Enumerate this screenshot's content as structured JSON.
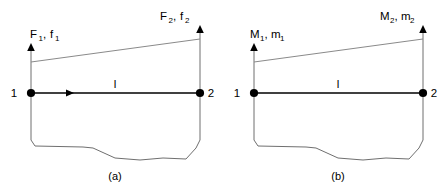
{
  "figure": {
    "colors": {
      "beam": "#000000",
      "guide": "#6f6f6f",
      "slope": "#8a8a8a",
      "text": "#000000",
      "background": "#ffffff"
    }
  },
  "panels": [
    {
      "id": "a",
      "caption": "(a)",
      "quantity": "force",
      "node_start": {
        "label": "1",
        "load_symbol": "F",
        "load_symbol_small": "f",
        "subscript": "1",
        "load_label": "F1, f1",
        "arrow_direction": "up"
      },
      "node_end": {
        "label": "2",
        "load_symbol": "F",
        "load_symbol_small": "f",
        "subscript": "2",
        "load_label": "F2, f2",
        "arrow_direction": "up"
      },
      "length_label": "l",
      "has_axial_arrow": true
    },
    {
      "id": "b",
      "caption": "(b)",
      "quantity": "moment",
      "node_start": {
        "label": "1",
        "load_symbol": "M",
        "load_symbol_small": "m",
        "subscript": "1",
        "load_label": "M1, m1",
        "arrow_direction": "up"
      },
      "node_end": {
        "label": "2",
        "load_symbol": "M",
        "load_symbol_small": "m",
        "subscript": "2",
        "load_label": "M2, m2",
        "arrow_direction": "up"
      },
      "length_label": "l",
      "has_axial_arrow": false
    }
  ],
  "separator": ","
}
